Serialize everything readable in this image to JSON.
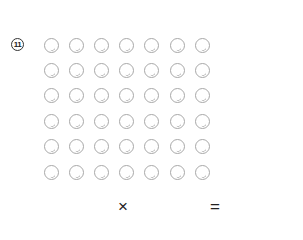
{
  "problem": {
    "number_label": "11",
    "grid": {
      "rows": 6,
      "columns": 7,
      "item": "circle"
    },
    "equation": {
      "times_symbol": "×",
      "equals_symbol": "="
    }
  }
}
